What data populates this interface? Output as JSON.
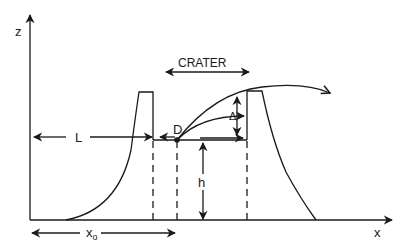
{
  "diagram": {
    "type": "crater cross-section schematic",
    "axes": {
      "vertical_label": "z",
      "horizontal_label": "x"
    },
    "labels": {
      "crater": "CRATER",
      "length": "L",
      "point": "D",
      "delta": "Δ",
      "height": "h",
      "x_origin_main": "x",
      "x_origin_sub": "o"
    },
    "colors": {
      "stroke": "#1a1a1a",
      "background": "#ffffff"
    }
  }
}
